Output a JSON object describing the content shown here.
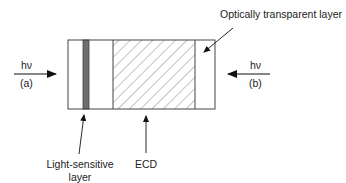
{
  "diagram": {
    "type": "layered-device-cross-section",
    "colors": {
      "outline": "#444444",
      "light_sensitive_fill": "#6e6e6e",
      "hatch": "#8a8a8a",
      "text": "#222222",
      "background": "#ffffff"
    },
    "layers": [
      {
        "id": "substrate-left",
        "label": ""
      },
      {
        "id": "light-sensitive",
        "label": "Light-sensitive layer"
      },
      {
        "id": "ecd",
        "label": "ECD"
      },
      {
        "id": "transparent",
        "label": "Optically transparent layer"
      }
    ],
    "illumination": {
      "left": {
        "symbol": "hν",
        "tag": "(a)",
        "direction": "right"
      },
      "right": {
        "symbol": "hν",
        "tag": "(b)",
        "direction": "left"
      }
    },
    "labels": {
      "optically_transparent": "Optically transparent layer",
      "light_sensitive_line1": "Light-sensitive",
      "light_sensitive_line2": "layer",
      "ecd": "ECD"
    }
  }
}
